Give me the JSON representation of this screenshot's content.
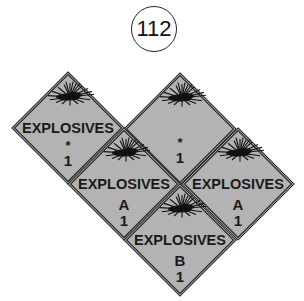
{
  "figure_number": "112",
  "colors": {
    "placard_fill": "#b3b3b3",
    "outline": "#2a2a2a",
    "text": "#1a1a1a",
    "background": "#ffffff"
  },
  "placards": [
    {
      "id": "left",
      "cx": 68,
      "cy": 128,
      "word": "EXPLOSIVES",
      "division": "*",
      "class": "1",
      "show_word": true
    },
    {
      "id": "top-right",
      "cx": 180,
      "cy": 129,
      "word": "",
      "division": "*",
      "class": "1",
      "show_word": false
    },
    {
      "id": "middle-left",
      "cx": 124,
      "cy": 184,
      "word": "EXPLOSIVES",
      "division": "A",
      "class": "1",
      "show_word": true
    },
    {
      "id": "middle-right",
      "cx": 238,
      "cy": 184,
      "word": "EXPLOSIVES",
      "division": "A",
      "class": "1",
      "show_word": true
    },
    {
      "id": "bottom",
      "cx": 180,
      "cy": 240,
      "word": "EXPLOSIVES",
      "division": "B",
      "class": "1",
      "show_word": true
    }
  ]
}
